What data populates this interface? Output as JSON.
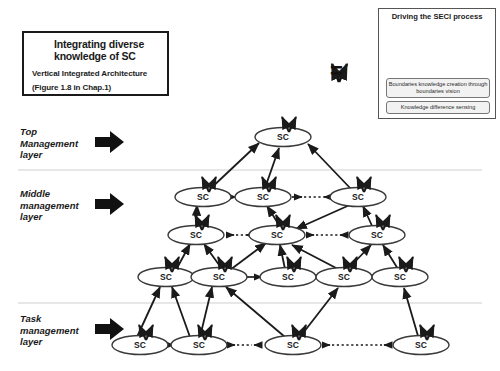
{
  "legend": {
    "arrow_icon": "vertical-double-arrow-icon",
    "line1": "Integrating diverse",
    "line2": "knowledge of SC",
    "sub1": "Vertical Integrated Architecture",
    "sub2": "(Figure 1.8 in Chap.1)"
  },
  "equivalence": {
    "symbol": "V =",
    "v_icon": "v-double-arrow-icon"
  },
  "seci": {
    "title": "Driving the SECI process",
    "disc_icon": "seci-spiral-disc-icon",
    "arrow_icon": "up-block-arrow-icon",
    "box1": "Boundaries knowledge creation through boundaries vision",
    "box2": "Knowledge difference sensing"
  },
  "layers": [
    {
      "id": "top",
      "label": "Top\nManagement\nlayer",
      "arrow_icon": "right-block-arrow-icon"
    },
    {
      "id": "middle",
      "label": "Middle\nmanagement\nlayer",
      "arrow_icon": "right-block-arrow-icon"
    },
    {
      "id": "task",
      "label": "Task\nmanagement\nlayer",
      "arrow_icon": "right-block-arrow-icon"
    }
  ],
  "node_label": "SC",
  "chart_data": {
    "type": "diagram",
    "rows": [
      {
        "row": 1,
        "layer": "top",
        "y": 137,
        "nodes": [
          {
            "id": "n1-1",
            "x": 283
          }
        ]
      },
      {
        "row": 2,
        "layer": "middle",
        "y": 197,
        "nodes": [
          {
            "id": "n2-1",
            "x": 203
          },
          {
            "id": "n2-2",
            "x": 263
          },
          {
            "id": "n2-3",
            "x": 358
          }
        ]
      },
      {
        "row": 3,
        "layer": "middle",
        "y": 235,
        "nodes": [
          {
            "id": "n3-1",
            "x": 196
          },
          {
            "id": "n3-2",
            "x": 277
          },
          {
            "id": "n3-3",
            "x": 377
          }
        ]
      },
      {
        "row": 4,
        "layer": "middle",
        "y": 277,
        "nodes": [
          {
            "id": "n4-1",
            "x": 166
          },
          {
            "id": "n4-2",
            "x": 219
          },
          {
            "id": "n4-3",
            "x": 288
          },
          {
            "id": "n4-4",
            "x": 344
          },
          {
            "id": "n4-5",
            "x": 400
          }
        ]
      },
      {
        "row": 5,
        "layer": "task",
        "y": 345,
        "nodes": [
          {
            "id": "n5-1",
            "x": 140
          },
          {
            "id": "n5-2",
            "x": 199
          },
          {
            "id": "n5-3",
            "x": 293
          },
          {
            "id": "n5-4",
            "x": 421
          }
        ]
      }
    ],
    "separators_y": [
      170,
      303
    ],
    "node_rx": 28,
    "node_ry": 9.5,
    "legend_note": "Each SC node carries a vertical double-arrow denoting integrating diverse knowledge of SC"
  }
}
